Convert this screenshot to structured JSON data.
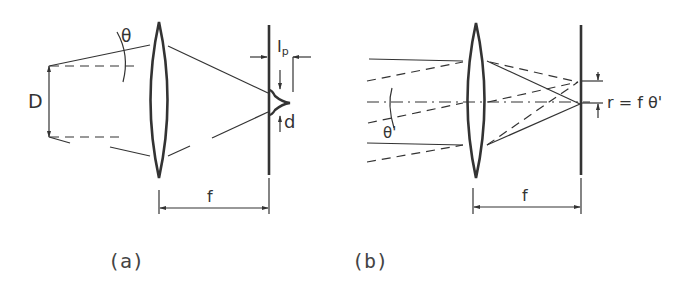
{
  "figure": {
    "panels": [
      {
        "id": "a",
        "caption": "(a)",
        "labels": {
          "angle": "θ",
          "aperture": "D",
          "intensity": "I",
          "intensity_subscript": "p",
          "spot_diameter": "d",
          "focal_length": "f"
        }
      },
      {
        "id": "b",
        "caption": "(b)",
        "labels": {
          "angle": "θ'",
          "radius_formula": "r = f θ'",
          "focal_length": "f"
        }
      }
    ]
  }
}
